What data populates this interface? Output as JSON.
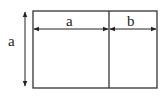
{
  "diagram": {
    "labels": {
      "left_height": "a",
      "top_square_width": "a",
      "top_rect_width": "b"
    },
    "colors": {
      "stroke": "#333333",
      "text": "#222222",
      "background": "#ffffff"
    }
  }
}
